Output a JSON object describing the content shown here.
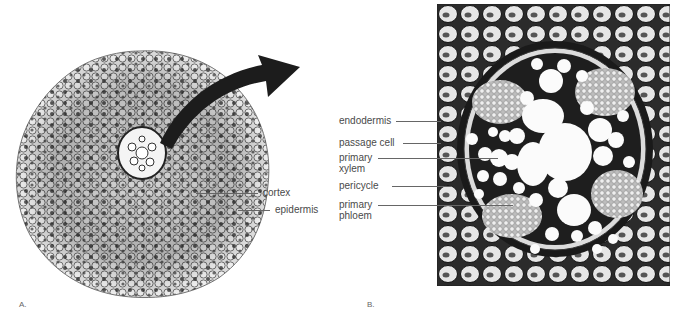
{
  "figure": {
    "panels": [
      {
        "id": "A",
        "letter": "A.",
        "description": "Cross section of a whole root with an arrow pointing from the central vascular cylinder toward an enlarged view",
        "labels": [
          {
            "text": "cortex"
          },
          {
            "text": "epidermis"
          }
        ]
      },
      {
        "id": "B",
        "letter": "B.",
        "description": "Enlarged micrograph of the root's vascular cylinder",
        "labels": [
          {
            "text": "endodermis"
          },
          {
            "text": "passage cell"
          },
          {
            "text": "primary xylem",
            "lines": [
              "primary",
              "xylem"
            ]
          },
          {
            "text": "pericycle"
          },
          {
            "text": "primary phloem",
            "lines": [
              "primary",
              "phloem"
            ]
          }
        ]
      }
    ],
    "colors": {
      "background": "#ffffff",
      "label_text": "#4a4a4a",
      "leader_line": "#666666",
      "arrow": "#1c1c1c",
      "tissue_dark": "#1a1a1a",
      "tissue_light": "#f2f2f2"
    }
  }
}
